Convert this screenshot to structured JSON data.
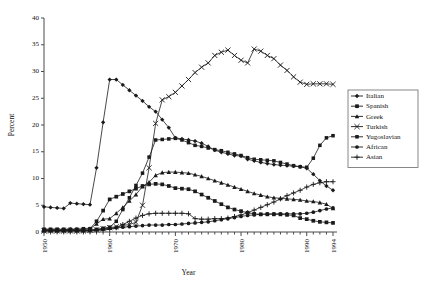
{
  "chart_data": {
    "type": "line",
    "title": "",
    "xlabel": "Year",
    "ylabel": "Percent",
    "xlim": [
      1950,
      1994
    ],
    "ylim": [
      0,
      40
    ],
    "yticks": [
      0,
      5,
      10,
      15,
      20,
      25,
      30,
      35,
      40
    ],
    "xticks": [
      1950,
      1960,
      1970,
      1980,
      1990,
      1994
    ],
    "xtick_labels": [
      "1950",
      "1960",
      "1970",
      "1980",
      "1990",
      "1994"
    ],
    "ytick_labels": [
      "0",
      "5",
      "10",
      "15",
      "20",
      "25",
      "30",
      "35",
      "40"
    ],
    "grid": false,
    "legend_position": "right",
    "x": [
      1950,
      1951,
      1952,
      1953,
      1954,
      1955,
      1956,
      1957,
      1958,
      1959,
      1960,
      1961,
      1962,
      1963,
      1964,
      1965,
      1966,
      1967,
      1968,
      1969,
      1970,
      1971,
      1972,
      1973,
      1974,
      1975,
      1976,
      1977,
      1978,
      1979,
      1980,
      1981,
      1982,
      1983,
      1984,
      1985,
      1986,
      1987,
      1988,
      1989,
      1990,
      1991,
      1992,
      1993,
      1994
    ],
    "series": [
      {
        "name": "Italian",
        "marker": "filled-diamond",
        "values": [
          4.7,
          4.6,
          4.5,
          4.4,
          5.4,
          5.3,
          5.2,
          5.1,
          12.0,
          20.5,
          28.5,
          28.5,
          27.5,
          26.5,
          25.5,
          24.5,
          23.4,
          22.5,
          21.0,
          19.5,
          17.6,
          17.4,
          17.2,
          17.0,
          16.6,
          16.0,
          15.3,
          14.9,
          14.6,
          14.3,
          14.2,
          13.6,
          13.3,
          13.0,
          12.8,
          12.6,
          12.5,
          12.4,
          12.3,
          12.2,
          11.9,
          10.8,
          9.6,
          8.6,
          7.8
        ]
      },
      {
        "name": "Spanish",
        "marker": "filled-square",
        "values": [
          0.5,
          0.5,
          0.5,
          0.5,
          0.5,
          0.5,
          0.6,
          0.6,
          2.0,
          4.0,
          6.1,
          6.6,
          7.1,
          7.6,
          8.1,
          8.6,
          8.9,
          9.0,
          8.9,
          8.6,
          8.2,
          8.1,
          8.0,
          7.6,
          7.0,
          6.4,
          5.8,
          5.2,
          4.6,
          4.2,
          3.9,
          3.6,
          3.4,
          3.3,
          3.3,
          3.3,
          3.3,
          3.2,
          3.1,
          2.6,
          2.4,
          2.1,
          1.9,
          1.8,
          1.7
        ]
      },
      {
        "name": "Greek",
        "marker": "filled-triangle",
        "values": [
          0.4,
          0.4,
          0.4,
          0.4,
          0.5,
          0.5,
          0.5,
          0.6,
          1.5,
          2.4,
          2.5,
          3.5,
          4.6,
          5.8,
          7.0,
          8.5,
          9.3,
          10.6,
          11.1,
          11.2,
          11.2,
          11.1,
          11.0,
          10.7,
          10.4,
          10.0,
          9.6,
          9.2,
          8.8,
          8.4,
          8.0,
          7.6,
          7.2,
          6.9,
          6.6,
          6.4,
          6.3,
          6.2,
          6.1,
          6.0,
          5.8,
          5.7,
          5.5,
          5.2,
          4.4
        ]
      },
      {
        "name": "Turkish",
        "marker": "cross-x",
        "values": [
          0.2,
          0.2,
          0.2,
          0.2,
          0.2,
          0.2,
          0.2,
          0.3,
          0.4,
          0.6,
          0.8,
          1.0,
          1.2,
          1.4,
          1.8,
          5.0,
          12.0,
          20.3,
          24.7,
          25.3,
          26.1,
          27.3,
          28.5,
          29.8,
          30.8,
          31.6,
          33.0,
          33.6,
          34.0,
          33.0,
          32.1,
          31.6,
          34.2,
          33.8,
          33.0,
          32.4,
          31.2,
          30.2,
          29.0,
          28.0,
          27.6,
          27.7,
          27.7,
          27.7,
          27.6
        ]
      },
      {
        "name": "Yugoslavian",
        "marker": "filled-square-small",
        "values": [
          0.3,
          0.3,
          0.3,
          0.3,
          0.3,
          0.3,
          0.3,
          0.4,
          0.5,
          0.7,
          0.9,
          2.0,
          4.2,
          6.4,
          8.7,
          11.0,
          14.0,
          17.2,
          17.3,
          17.4,
          17.5,
          17.2,
          16.7,
          16.2,
          16.0,
          15.7,
          15.4,
          15.2,
          14.9,
          14.6,
          14.3,
          13.9,
          13.6,
          13.5,
          13.4,
          13.3,
          13.0,
          12.7,
          12.4,
          12.2,
          12.1,
          13.8,
          16.2,
          17.6,
          18.0
        ]
      },
      {
        "name": "African",
        "marker": "filled-circle",
        "values": [
          0.3,
          0.3,
          0.3,
          0.3,
          0.3,
          0.3,
          0.3,
          0.3,
          0.4,
          0.5,
          0.7,
          0.8,
          0.9,
          1.0,
          1.1,
          1.2,
          1.3,
          1.3,
          1.3,
          1.4,
          1.4,
          1.5,
          1.6,
          1.7,
          1.8,
          1.9,
          2.1,
          2.3,
          2.5,
          2.7,
          2.9,
          3.1,
          3.2,
          3.3,
          3.4,
          3.4,
          3.4,
          3.4,
          3.4,
          3.4,
          3.5,
          3.7,
          4.0,
          4.3,
          4.5
        ]
      },
      {
        "name": "Asian",
        "marker": "plus",
        "values": [
          0.2,
          0.2,
          0.2,
          0.2,
          0.2,
          0.2,
          0.2,
          0.2,
          0.3,
          0.4,
          0.5,
          0.8,
          1.4,
          2.0,
          2.6,
          3.1,
          3.4,
          3.5,
          3.5,
          3.5,
          3.5,
          3.5,
          3.4,
          2.5,
          2.4,
          2.4,
          2.5,
          2.5,
          2.6,
          2.9,
          3.2,
          3.6,
          4.1,
          4.6,
          5.1,
          5.6,
          6.2,
          6.8,
          7.3,
          7.8,
          8.4,
          8.9,
          9.2,
          9.4,
          9.4
        ]
      }
    ]
  },
  "legend": {
    "items": [
      {
        "label": "Italian"
      },
      {
        "label": "Spanish"
      },
      {
        "label": "Greek"
      },
      {
        "label": "Turkish"
      },
      {
        "label": "Yugoslavian"
      },
      {
        "label": "African"
      },
      {
        "label": "Asian"
      }
    ]
  }
}
